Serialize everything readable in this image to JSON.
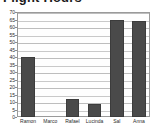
{
  "chart_data": {
    "type": "bar",
    "title": "Flight Hours",
    "title_clipped": true,
    "categories": [
      "Ramon",
      "Marco",
      "Rafael",
      "Lucinda",
      "Sal",
      "Anna"
    ],
    "values": [
      40,
      0,
      12,
      9,
      65,
      64
    ],
    "xlabel": "",
    "ylabel": "",
    "ylim": [
      0,
      70
    ],
    "ytick_step": 5,
    "yticks": [
      0,
      5,
      10,
      15,
      20,
      25,
      30,
      35,
      40,
      45,
      50,
      55,
      60,
      65,
      70
    ],
    "ytick_labels": [
      "0",
      "5",
      "10",
      "15",
      "20",
      "25",
      "30",
      "35",
      "40",
      "45",
      "50",
      "55",
      "60",
      "65",
      "70"
    ],
    "grid": true,
    "grid_axis": "y",
    "legend": false,
    "legend_position": "none",
    "bar_color": "#4a4a4a",
    "bar_border_color": "#3c3c3c",
    "plot_background": "#fefefe",
    "grid_color": "#c9c9c9",
    "frame_color": "#9a9a9a",
    "text_color": "#2b2b2b",
    "title_color": "#1a1a1a"
  }
}
